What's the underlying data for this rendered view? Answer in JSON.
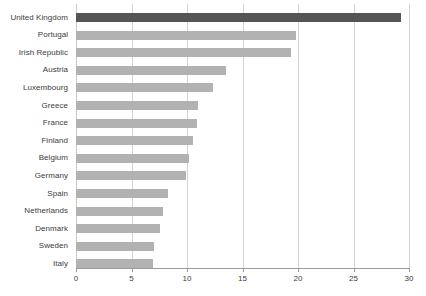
{
  "chart_data": {
    "type": "bar",
    "orientation": "horizontal",
    "title": "",
    "xlabel": "",
    "ylabel": "",
    "xlim": [
      0,
      30
    ],
    "xticks": [
      0,
      5,
      10,
      15,
      20,
      25,
      30
    ],
    "xtick_labels": [
      "0",
      "5",
      "10",
      "15",
      "20",
      "25",
      "30"
    ],
    "grid": "vertical",
    "legend": "none",
    "categories": [
      "United Kingdom",
      "Portugal",
      "Irish Republic",
      "Austria",
      "Luxembourg",
      "Greece",
      "France",
      "Finland",
      "Belgium",
      "Germany",
      "Spain",
      "Netherlands",
      "Denmark",
      "Sweden",
      "Italy"
    ],
    "values": [
      29.3,
      19.8,
      19.4,
      13.5,
      12.3,
      11.0,
      10.9,
      10.5,
      10.2,
      9.9,
      8.3,
      7.8,
      7.6,
      7.0,
      6.9
    ],
    "highlight_category": "United Kingdom",
    "colors": {
      "bar": "#b2b2b2",
      "bar_highlight": "#555555",
      "gridline": "#d2d2d2",
      "axis": "#9a9a9a",
      "text": "#3b3b3b",
      "background": "#ffffff"
    }
  }
}
